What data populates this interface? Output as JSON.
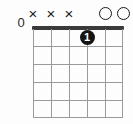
{
  "diagram": {
    "type": "guitar-chord-diagram",
    "fret_position_label": "0",
    "string_count": 6,
    "fret_count": 5,
    "colors": {
      "background": "#fdfdfd",
      "grid_line": "#9a9a9a",
      "nut": "#3a3a3a",
      "marker": "#1a1a1a",
      "finger_dot_fill": "#141414",
      "finger_dot_text": "#ffffff"
    },
    "string_markers": [
      {
        "string": 1,
        "symbol": "×",
        "type": "muted"
      },
      {
        "string": 2,
        "symbol": "×",
        "type": "muted"
      },
      {
        "string": 3,
        "symbol": "×",
        "type": "muted"
      },
      {
        "string": 4,
        "symbol": "",
        "type": "fretted"
      },
      {
        "string": 5,
        "symbol": "",
        "type": "open"
      },
      {
        "string": 6,
        "symbol": "",
        "type": "open"
      }
    ],
    "finger_dots": [
      {
        "string": 4,
        "fret": 1,
        "finger": "1"
      }
    ],
    "fret_rows": [
      "1",
      "2",
      "3",
      "4",
      "5"
    ]
  }
}
